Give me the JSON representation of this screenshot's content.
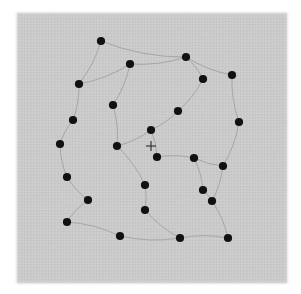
{
  "figure": {
    "background_color": "#ffffff",
    "panel": {
      "name": "gray-plate",
      "x": 17,
      "y": 13,
      "width": 270,
      "height": 270,
      "fill_color": "#c9c9c9",
      "texture": "halftone-grain",
      "edge_softness": "feathered"
    },
    "center_marker": {
      "name": "center-cross",
      "glyph": "+",
      "x": 151,
      "y": 146,
      "arm_length": 5,
      "color": "#2b2b2b"
    },
    "dot_style": {
      "radius": 4.1,
      "color": "#111111"
    },
    "link_style": {
      "color": "#8d8d8d",
      "width": 0.7
    }
  },
  "chart_data": {
    "type": "scatter",
    "xlabel": "",
    "ylabel": "",
    "xlim": [
      17,
      287
    ],
    "ylim": [
      13,
      283
    ],
    "grid": false,
    "legend": "none",
    "annotations": [
      {
        "label": "+",
        "x": 151,
        "y": 146,
        "kind": "center-cross"
      }
    ],
    "point_count": 26,
    "points": [
      {
        "id": 1,
        "x": 101,
        "y": 41
      },
      {
        "id": 2,
        "x": 186,
        "y": 57
      },
      {
        "id": 3,
        "x": 130,
        "y": 64
      },
      {
        "id": 4,
        "x": 232,
        "y": 75
      },
      {
        "id": 5,
        "x": 203,
        "y": 79
      },
      {
        "id": 6,
        "x": 79,
        "y": 84
      },
      {
        "id": 7,
        "x": 113,
        "y": 105
      },
      {
        "id": 8,
        "x": 178,
        "y": 111
      },
      {
        "id": 9,
        "x": 73,
        "y": 120
      },
      {
        "id": 10,
        "x": 239,
        "y": 122
      },
      {
        "id": 11,
        "x": 151,
        "y": 130
      },
      {
        "id": 12,
        "x": 60,
        "y": 144
      },
      {
        "id": 13,
        "x": 117,
        "y": 146
      },
      {
        "id": 14,
        "x": 157,
        "y": 157
      },
      {
        "id": 15,
        "x": 194,
        "y": 158
      },
      {
        "id": 16,
        "x": 223,
        "y": 166
      },
      {
        "id": 17,
        "x": 67,
        "y": 177
      },
      {
        "id": 18,
        "x": 145,
        "y": 185
      },
      {
        "id": 19,
        "x": 203,
        "y": 190
      },
      {
        "id": 20,
        "x": 88,
        "y": 200
      },
      {
        "id": 21,
        "x": 212,
        "y": 201
      },
      {
        "id": 22,
        "x": 145,
        "y": 210
      },
      {
        "id": 23,
        "x": 67,
        "y": 222
      },
      {
        "id": 24,
        "x": 120,
        "y": 236
      },
      {
        "id": 25,
        "x": 180,
        "y": 238
      },
      {
        "id": 26,
        "x": 228,
        "y": 238
      }
    ],
    "links": [
      {
        "from": 1,
        "to": 6
      },
      {
        "from": 1,
        "to": 2
      },
      {
        "from": 2,
        "to": 3
      },
      {
        "from": 2,
        "to": 4
      },
      {
        "from": 3,
        "to": 6
      },
      {
        "from": 5,
        "to": 2
      },
      {
        "from": 5,
        "to": 8
      },
      {
        "from": 4,
        "to": 10
      },
      {
        "from": 6,
        "to": 9
      },
      {
        "from": 7,
        "to": 3
      },
      {
        "from": 7,
        "to": 13
      },
      {
        "from": 9,
        "to": 12
      },
      {
        "from": 10,
        "to": 16
      },
      {
        "from": 11,
        "to": 8
      },
      {
        "from": 11,
        "to": 13
      },
      {
        "from": 12,
        "to": 17
      },
      {
        "from": 13,
        "to": 18
      },
      {
        "from": 14,
        "to": 11
      },
      {
        "from": 14,
        "to": 15
      },
      {
        "from": 15,
        "to": 16
      },
      {
        "from": 16,
        "to": 21
      },
      {
        "from": 17,
        "to": 20
      },
      {
        "from": 18,
        "to": 22
      },
      {
        "from": 19,
        "to": 15
      },
      {
        "from": 19,
        "to": 21
      },
      {
        "from": 20,
        "to": 23
      },
      {
        "from": 21,
        "to": 26
      },
      {
        "from": 22,
        "to": 25
      },
      {
        "from": 23,
        "to": 24
      },
      {
        "from": 24,
        "to": 25
      },
      {
        "from": 25,
        "to": 26
      }
    ]
  }
}
